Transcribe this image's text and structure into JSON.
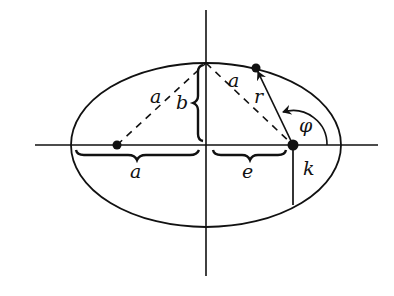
{
  "diagram": {
    "stroke_color": "#111111",
    "background": "#ffffff",
    "labels": {
      "a_dashed_left": "a",
      "b_semi_minor": "b",
      "a_dashed_right": "a",
      "r_radius": "r",
      "phi_angle": "φ",
      "a_semi_major": "a",
      "e_focal_distance": "e",
      "k_semi_latus": "k"
    },
    "elements": [
      "ellipse",
      "horizontal-axis",
      "vertical-axis",
      "left-focus",
      "right-focus",
      "point-on-ellipse",
      "dashed-line-focus-to-top",
      "dashed-line-top-to-focus",
      "radius-vector-r",
      "angle-arc-phi",
      "brace-a",
      "brace-b",
      "brace-e",
      "latus-segment-k"
    ]
  }
}
